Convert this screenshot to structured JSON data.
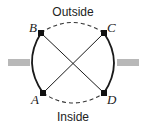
{
  "diagram": {
    "labels": {
      "top": "Outside",
      "bottom": "Inside"
    },
    "points": [
      {
        "name": "A",
        "x": 43,
        "y": 93
      },
      {
        "name": "B",
        "x": 41,
        "y": 33
      },
      {
        "name": "C",
        "x": 104,
        "y": 33
      },
      {
        "name": "D",
        "x": 104,
        "y": 93
      }
    ],
    "colors": {
      "line": "#1a1a1a",
      "bar": "#b5b5b5",
      "dashed": "#333333"
    }
  }
}
